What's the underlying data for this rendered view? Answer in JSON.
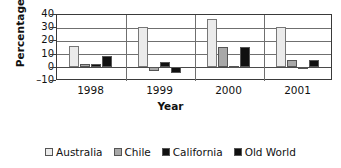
{
  "chart_data": {
    "type": "bar",
    "title": "",
    "xlabel": "Year",
    "ylabel": "Percentage",
    "categories": [
      "1998",
      "1999",
      "2000",
      "2001"
    ],
    "ylim": [
      -10,
      40
    ],
    "yticks": [
      40,
      30,
      20,
      10,
      0,
      -10
    ],
    "grid": true,
    "legend_position": "bottom",
    "series": [
      {
        "name": "Australia",
        "color": "#ebebeb",
        "values": [
          16,
          30,
          36,
          30
        ]
      },
      {
        "name": "Chile",
        "color": "#a8a8a8",
        "values": [
          2,
          -3,
          15,
          5
        ]
      },
      {
        "name": "California",
        "color": "#101010",
        "values": [
          2.5,
          4,
          0.5,
          -1.5
        ]
      },
      {
        "name": "Old World",
        "color": "#101010",
        "values": [
          8,
          -5,
          15,
          5.5
        ]
      }
    ]
  },
  "axis": {
    "y_title": "Percentage",
    "x_title": "Year",
    "y_tick_labels": [
      "40",
      "30",
      "20",
      "10",
      "0",
      "–10"
    ],
    "x_tick_labels": [
      "1998",
      "1999",
      "2000",
      "2001"
    ]
  },
  "legend": {
    "items": [
      {
        "label": "Australia"
      },
      {
        "label": "Chile"
      },
      {
        "label": "California"
      },
      {
        "label": "Old World"
      }
    ]
  }
}
